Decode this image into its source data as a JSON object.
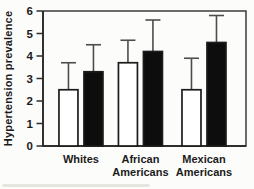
{
  "chart_data": {
    "type": "bar",
    "title": "",
    "ylabel": "Hypertension prevalence",
    "xlabel": "",
    "categories": [
      "Whites",
      "African Americans",
      "Mexican Americans"
    ],
    "series": [
      {
        "name": "open-bars",
        "fill": "#ffffff",
        "values": [
          2.5,
          3.7,
          2.5
        ],
        "error_upper": [
          1.2,
          1.0,
          1.4
        ]
      },
      {
        "name": "filled-bars",
        "fill": "#0d0d0d",
        "values": [
          3.3,
          4.2,
          4.6
        ],
        "error_upper": [
          1.2,
          1.4,
          1.2
        ]
      }
    ],
    "ylim": [
      0,
      6
    ],
    "yticks": [
      0,
      1,
      2,
      3,
      4,
      5,
      6
    ],
    "grid": false,
    "legend_position": "none"
  },
  "colors": {
    "background": "#fcfcfa",
    "plot_border": "#2e2e2e",
    "bar_outline": "#1c1c1c",
    "error_bar": "#4d4d4d",
    "text": "#1b1b1b"
  }
}
